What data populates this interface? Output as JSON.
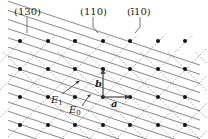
{
  "labels": {
    "plane_130": "(130)",
    "plane_110": "(110)",
    "plane_m110": "(ī10)",
    "vec_a": "a",
    "vec_b": "b",
    "E1": "E",
    "E1_sub": "1",
    "E0": "E",
    "E0_sub": "0"
  },
  "lattice": {
    "xs": [
      20,
      48,
      75,
      103,
      130,
      158,
      185
    ],
    "ys": [
      41,
      69,
      97,
      125
    ],
    "origin": [
      103,
      97
    ],
    "spacing": 27.5
  },
  "colors": {
    "dot": "#111111",
    "solid_line": "#555555",
    "dashed_line": "#9a9a9a",
    "vector": "#444444"
  }
}
